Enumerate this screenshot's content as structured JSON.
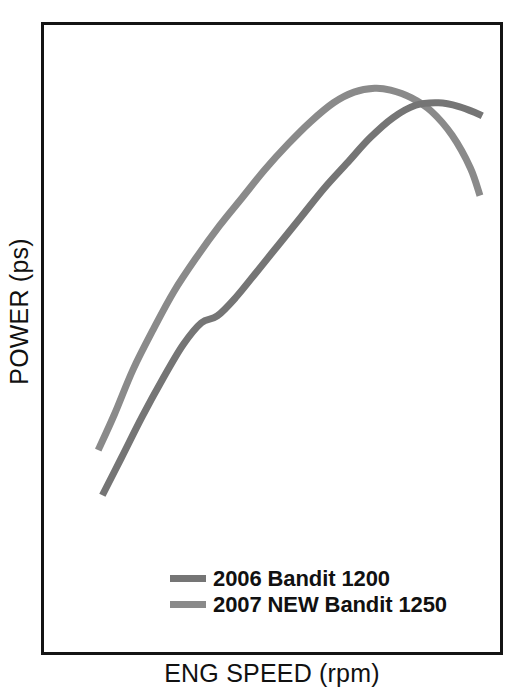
{
  "figure": {
    "background_color": "#ffffff",
    "frame_color": "#141414"
  },
  "axes": {
    "y_label": "POWER (ps)",
    "x_label": "ENG SPEED (rpm)"
  },
  "legend": {
    "position": "inside-bottom-left",
    "items": [
      {
        "label": "2006 Bandit 1200",
        "color": "#757575",
        "swatch_name": "legend-swatch-2006"
      },
      {
        "label": "2007 NEW Bandit 1250",
        "color": "#8a8a8a",
        "swatch_name": "legend-swatch-2007"
      }
    ]
  },
  "chart_data": {
    "type": "line",
    "title": "",
    "subtitle": "",
    "xlabel": "ENG SPEED (rpm)",
    "ylabel": "POWER (ps)",
    "grid": false,
    "legend_position": "inside-bottom-left",
    "xlim": [
      0,
      100
    ],
    "ylim": [
      0,
      100
    ],
    "x_tick_labels": [],
    "y_tick_labels": [],
    "annotations": [],
    "series": [
      {
        "name": "2006 Bandit 1200",
        "color": "#757575",
        "line_width": 7,
        "x": [
          12.8,
          17.0,
          21.5,
          26.0,
          30.5,
          34.5,
          38.0,
          42.0,
          46.5,
          51.5,
          56.5,
          61.5,
          66.5,
          71.5,
          76.5,
          81.5,
          86.5,
          91.0,
          95.0,
          96.1
        ],
        "y": [
          25.0,
          31.0,
          37.5,
          43.5,
          49.0,
          52.5,
          53.6,
          56.5,
          60.5,
          65.0,
          69.5,
          74.0,
          78.0,
          82.0,
          85.2,
          87.2,
          87.6,
          87.0,
          85.9,
          85.5
        ]
      },
      {
        "name": "2007 NEW Bandit 1250",
        "color": "#8a8a8a",
        "line_width": 7,
        "x": [
          11.9,
          15.5,
          19.5,
          24.0,
          28.5,
          33.5,
          38.5,
          43.5,
          48.5,
          53.5,
          58.5,
          63.5,
          68.0,
          72.5,
          76.0,
          80.5,
          85.0,
          89.5,
          93.5,
          95.6
        ],
        "y": [
          32.2,
          38.0,
          45.0,
          51.5,
          57.5,
          63.0,
          68.0,
          72.5,
          77.0,
          81.0,
          84.6,
          87.6,
          89.3,
          89.9,
          89.6,
          88.4,
          86.2,
          82.4,
          77.2,
          72.8
        ]
      }
    ],
    "notes": [
      "Axis tick values are not printed on the figure; x/y are normalized 0-100 percentages of the plot box.",
      "The 2007 curve starts higher, rises faster, peaks earlier, then crosses below the 2006 curve near the right side.",
      "The 2006 curve shows a small plateau/step in its mid rise."
    ]
  }
}
